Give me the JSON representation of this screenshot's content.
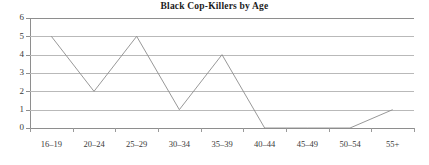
{
  "chart_data": {
    "type": "line",
    "title": "Black Cop-Killers by Age",
    "xlabel": "",
    "ylabel": "",
    "categories": [
      "16–19",
      "20–24",
      "25–29",
      "30–34",
      "35–39",
      "40–44",
      "45–49",
      "50–54",
      "55+"
    ],
    "values": [
      5,
      2,
      5,
      1,
      4,
      0,
      0,
      0,
      1
    ],
    "series": [
      {
        "name": "Black Cop-Killers",
        "values": [
          5,
          2,
          5,
          1,
          4,
          0,
          0,
          0,
          1
        ]
      }
    ],
    "ylim": [
      0,
      6
    ],
    "ytick_labels": [
      "6",
      "5",
      "4",
      "3",
      "2",
      "1",
      "0"
    ],
    "ytick_values": [
      6,
      5,
      4,
      3,
      2,
      1,
      0
    ],
    "grid": true,
    "legend": false,
    "legend_position": "none",
    "markers": false,
    "line_color": "#8c8c8c",
    "grid_color": "#b9b9b9",
    "axis_color": "#8e8e8e",
    "title_color": "#1c1c1c",
    "background_color": "#ffffff"
  }
}
